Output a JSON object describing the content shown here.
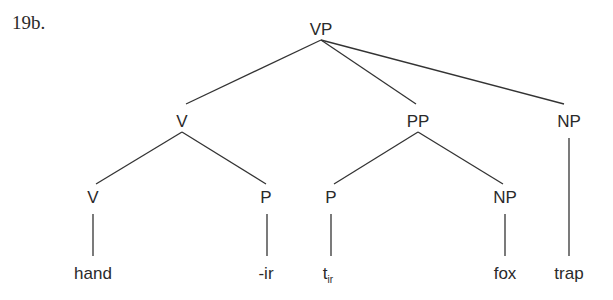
{
  "example_label": "19b.",
  "tree": {
    "root": "VP",
    "nodes": {
      "vp": "VP",
      "v1": "V",
      "pp": "PP",
      "np1": "NP",
      "v2": "V",
      "p1": "P",
      "p2": "P",
      "np2": "NP"
    },
    "leaves": {
      "hand": "hand",
      "ir": "-ir",
      "trace_base": "t",
      "trace_sub": "ir",
      "fox": "fox",
      "trap": "trap"
    },
    "structure": "[VP [V [V hand] [P -ir]] [PP [P t_ir] [NP fox]] [NP trap]]"
  }
}
